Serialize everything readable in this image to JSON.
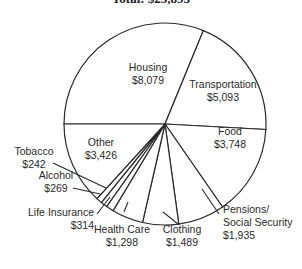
{
  "chart_data": {
    "type": "pie",
    "title": "Total: $25,893",
    "categories": [
      "Housing",
      "Transportation",
      "Food",
      "Pensions/Social Security",
      "Clothing",
      "Health Care",
      "Life Insurance",
      "Alcohol",
      "Tobacco",
      "Other"
    ],
    "values": [
      8079,
      5093,
      3748,
      1935,
      1489,
      1298,
      314,
      269,
      242,
      3426
    ],
    "value_labels": [
      "$8,079",
      "$5,093",
      "$3,748",
      "$1,935",
      "$1,489",
      "$1,298",
      "$314",
      "$269",
      "$242",
      "$3,426"
    ],
    "start_angle_deg": 180,
    "direction": "clockwise",
    "legend": "none (labels on/near slices)",
    "colors": {
      "fill": "#ffffff",
      "stroke": "#2a2a2a"
    }
  },
  "labels": [
    {
      "lines": [
        "Housing",
        "$8,079"
      ],
      "x": 148,
      "y": 71
    },
    {
      "lines": [
        "Transportation",
        "$5,093"
      ],
      "x": 223,
      "y": 88
    },
    {
      "lines": [
        "Food",
        "$3,748"
      ],
      "x": 230,
      "y": 135
    },
    {
      "lines": [
        "Pensions/",
        "Social Security",
        "$1,935"
      ],
      "x": 223,
      "y": 213,
      "anchor": "start"
    },
    {
      "lines": [
        "Clothing",
        "$1,489"
      ],
      "x": 182,
      "y": 233
    },
    {
      "lines": [
        "Health Care",
        "$1,298"
      ],
      "x": 122,
      "y": 233
    },
    {
      "lines": [
        "Life Insurance",
        "$314"
      ],
      "x": 94,
      "y": 216,
      "anchor": "end"
    },
    {
      "lines": [
        "Alcohol",
        "$269"
      ],
      "x": 56,
      "y": 179
    },
    {
      "lines": [
        "Tobacco",
        "$242"
      ],
      "x": 34,
      "y": 155
    },
    {
      "lines": [
        "Other",
        "$3,426"
      ],
      "x": 101,
      "y": 146
    }
  ],
  "leaders": [
    {
      "from": [
        53,
        163
      ],
      "to": [
        106,
        188
      ]
    },
    {
      "from": [
        73,
        188
      ],
      "to": [
        100,
        194
      ]
    },
    {
      "from": [
        97,
        214
      ],
      "to": [
        110,
        197
      ]
    },
    {
      "from": [
        124,
        212
      ],
      "to": [
        128,
        202
      ]
    },
    {
      "from": [
        163,
        212
      ],
      "to": [
        178,
        224
      ]
    },
    {
      "from": [
        202,
        189
      ],
      "to": [
        219,
        214
      ]
    }
  ]
}
